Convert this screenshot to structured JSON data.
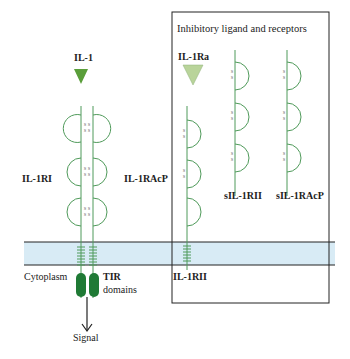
{
  "colors": {
    "stem": "#4f9a5a",
    "ligand": "#5a9e3a",
    "antagonist": "#b9d49a",
    "tir": "#1f7a35",
    "membrane": "#d8ebf5",
    "box": "#222222"
  },
  "labels": {
    "il1": "IL-1",
    "il1ri": "IL-1RI",
    "il1racp": "IL-1RAcP",
    "cytoplasm": "Cytoplasm",
    "tir": "TIR",
    "domains": "domains",
    "signal": "Signal",
    "box_title": "Inhibitory ligand and receptors",
    "il1ra": "IL-1Ra",
    "sil1rii": "sIL-1RII",
    "sil1racp": "sIL-1RAcP",
    "il1rii": "IL-1RII"
  },
  "disulfide": "S-S"
}
